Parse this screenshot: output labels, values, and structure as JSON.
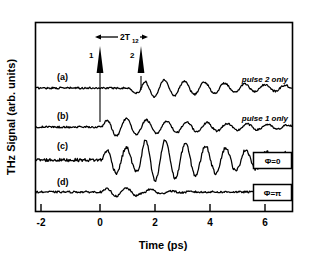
{
  "figure": {
    "domain": "chart",
    "background": "#ffffff",
    "ink": "#000000"
  },
  "chart_data": {
    "type": "line",
    "title": "",
    "xlabel": "Time (ps)",
    "ylabel": "THz Signal (arb. units)",
    "xlim": [
      -2.7,
      7.4
    ],
    "ylim": [
      0,
      1
    ],
    "xticks": [
      -2,
      0,
      2,
      4,
      6
    ],
    "xticklabels": [
      "-2",
      "0",
      "2",
      "4",
      "6"
    ],
    "yticks": [],
    "yticklabels": [],
    "grid": false,
    "legend_position": "inline-right",
    "series": [
      {
        "name": "(a)",
        "label": "(a)",
        "annotation": "pulse 2 only",
        "description": "flat baseline until t=1.5 ps, then damped oscillation of moderate amplitude",
        "onset_ps": 1.5,
        "period_ps": 0.72,
        "peak_amplitude": 0.6,
        "damping_ps": 4.2
      },
      {
        "name": "(b)",
        "label": "(b)",
        "annotation": "pulse 1 only",
        "description": "flat baseline until t=0 ps, then damped oscillation of moderate amplitude",
        "onset_ps": 0.15,
        "period_ps": 0.72,
        "peak_amplitude": 0.62,
        "damping_ps": 4.2
      },
      {
        "name": "(c)",
        "label": "(c)",
        "annotation": "Φ=0",
        "annotation_boxed": true,
        "description": "constructive interference: both pulses in phase, largest amplitude oscillation",
        "onset_ps": 0.15,
        "period_ps": 0.72,
        "peak_amplitude": 1.0,
        "damping_ps": 5.0
      },
      {
        "name": "(d)",
        "label": "(d)",
        "annotation": "Φ=π",
        "annotation_boxed": true,
        "description": "destructive interference: oscillation cancelled after initial transient, nearly flat",
        "onset_ps": 0.15,
        "period_ps": 0.72,
        "peak_amplitude": 0.28,
        "damping_ps": 1.0
      }
    ],
    "annotations": {
      "interval_label_main": "2T",
      "interval_label_sub": "12",
      "pulse_markers": [
        {
          "label": "1",
          "time_ps": 0.0
        },
        {
          "label": "2",
          "time_ps": 1.5
        }
      ]
    }
  }
}
